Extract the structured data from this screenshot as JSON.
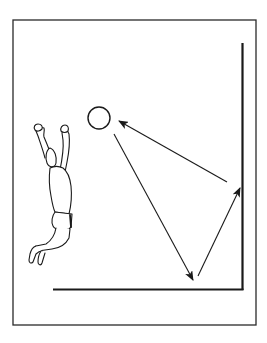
{
  "diagram": {
    "description": "Wall rebound drill: player jumps with arms raised; ball path shown hitting floor, then wall, then returning toward player",
    "colors": {
      "background": "#ffffff",
      "ink": "#1a1a1a",
      "frame": "#2a2a2a"
    },
    "frame": {
      "x": 13,
      "y": 20,
      "width": 243,
      "height": 305
    },
    "wall": {
      "x": 242,
      "y_top": 43,
      "y_bottom": 289
    },
    "floor": {
      "x_left": 53,
      "x_right": 243,
      "y": 289
    },
    "ball": {
      "cx": 99,
      "cy": 118,
      "r": 11
    },
    "arrows": [
      {
        "name": "ball-to-floor",
        "from": [
          114,
          134
        ],
        "to": [
          193,
          280
        ]
      },
      {
        "name": "floor-to-wall",
        "from": [
          198,
          276
        ],
        "to": [
          240,
          188
        ]
      },
      {
        "name": "wall-to-player",
        "from": [
          227,
          182
        ],
        "to": [
          119,
          121
        ]
      }
    ],
    "figure": {
      "label": "jumping-player",
      "x": 27,
      "y": 125,
      "width": 46,
      "height": 140
    }
  }
}
